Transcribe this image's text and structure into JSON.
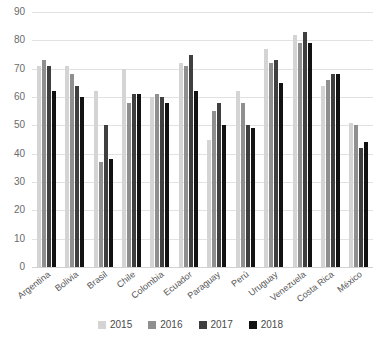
{
  "chart_data": {
    "type": "bar",
    "title": "",
    "subtitle": "",
    "xlabel": "",
    "ylabel": "",
    "ylim": [
      0,
      90
    ],
    "ytick_step": 10,
    "yticks": [
      0,
      10,
      20,
      30,
      40,
      50,
      60,
      70,
      80,
      90
    ],
    "grid": true,
    "legend_position": "bottom",
    "categories": [
      "Argentina",
      "Bolivia",
      "Brasil",
      "Chile",
      "Colombia",
      "Ecuador",
      "Paraguay",
      "Perú",
      "Uruguay",
      "Venezuela",
      "Costa Rica",
      "México"
    ],
    "series": [
      {
        "name": "2015",
        "color": "#d4d4d4",
        "values": [
          71,
          71,
          62,
          70,
          60,
          72,
          45,
          62,
          77,
          82,
          64,
          51
        ]
      },
      {
        "name": "2016",
        "color": "#8f8f8f",
        "values": [
          73,
          68,
          37,
          58,
          61,
          71,
          55,
          58,
          72,
          79,
          66,
          50
        ]
      },
      {
        "name": "2017",
        "color": "#3f3f3f",
        "values": [
          71,
          64,
          50,
          61,
          60,
          75,
          58,
          50,
          73,
          83,
          68,
          42
        ]
      },
      {
        "name": "2018",
        "color": "#121212",
        "values": [
          62,
          60,
          38,
          61,
          58,
          62,
          50,
          49,
          65,
          79,
          68,
          44
        ]
      }
    ]
  },
  "legend": {
    "items": [
      {
        "label": "2015",
        "color": "#d4d4d4"
      },
      {
        "label": "2016",
        "color": "#8f8f8f"
      },
      {
        "label": "2017",
        "color": "#3f3f3f"
      },
      {
        "label": "2018",
        "color": "#121212"
      }
    ]
  }
}
